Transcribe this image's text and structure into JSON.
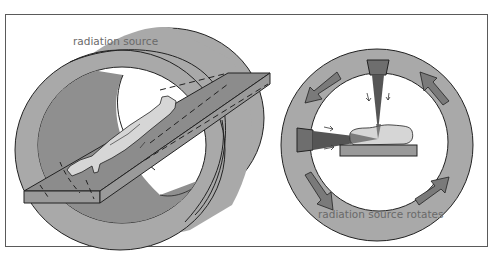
{
  "figure": {
    "left_panel": {
      "label": "radiation source",
      "components": [
        "gantry-ring",
        "patient-table",
        "patient"
      ]
    },
    "right_panel": {
      "label": "radiation source rotates",
      "components": [
        "gantry-ring",
        "radiation-source-top",
        "radiation-source-left",
        "x-ray-beams",
        "patient-cross-section",
        "table-cross-section",
        "rotation-arrows"
      ],
      "rotation_arrow_count": 4,
      "rotation_direction": "counter-clockwise"
    },
    "colors": {
      "ring": "#a9a9a9",
      "ring_dark": "#8f8f8f",
      "table": "#9a9a9a",
      "table_top": "#8c8c8c",
      "patient": "#d6d6d6",
      "beam": "#555555",
      "source": "#6e6e6e",
      "arrow": "#7a7a7a",
      "outline": "#222222",
      "label": "#6a6a6a"
    }
  }
}
